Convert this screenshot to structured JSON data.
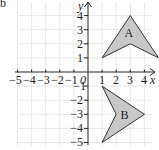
{
  "diagram": {
    "part_label": "b",
    "axes": {
      "x_label": "x",
      "y_label": "y",
      "origin_label": "0",
      "x_ticks": [
        "−5",
        "−4",
        "−3",
        "−2",
        "−1",
        "1",
        "2",
        "3",
        "4"
      ],
      "y_ticks": [
        "4",
        "3",
        "2",
        "1",
        "−1",
        "−2",
        "−3",
        "−4",
        "−5"
      ],
      "x_range": [
        -5,
        4
      ],
      "y_range": [
        -5,
        4
      ]
    },
    "shapes": [
      {
        "label": "A",
        "vertices": [
          [
            1,
            1
          ],
          [
            3,
            4
          ],
          [
            5,
            1
          ],
          [
            3,
            2
          ]
        ],
        "fill": "#c8c8c8"
      },
      {
        "label": "B",
        "vertices": [
          [
            1,
            -1
          ],
          [
            4,
            -3
          ],
          [
            1,
            -5
          ],
          [
            2,
            -3
          ]
        ],
        "fill": "#c8c8c8"
      }
    ],
    "colors": {
      "grid": "#e6e6e6",
      "axis": "#222222",
      "shape_stroke": "#333333"
    }
  }
}
